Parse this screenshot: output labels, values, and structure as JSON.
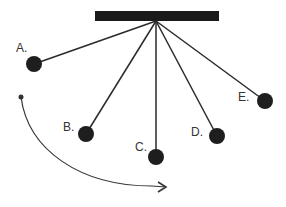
{
  "diagram": {
    "colors": {
      "bar": "#1a1a1a",
      "string": "#2a2a2a",
      "bob": "#1e1e1e",
      "arc": "#333333",
      "label": "#333333",
      "background": "#ffffff"
    },
    "support_bar": {
      "x": 95,
      "y": 11,
      "width": 124,
      "height": 10
    },
    "pivot": {
      "x": 156,
      "y": 21
    },
    "bob_radius": 8,
    "pendulums": [
      {
        "label": "A.",
        "bob": {
          "x": 34,
          "y": 64
        },
        "label_pos": {
          "x": 16,
          "y": 42
        }
      },
      {
        "label": "B.",
        "bob": {
          "x": 86,
          "y": 134
        },
        "label_pos": {
          "x": 63,
          "y": 121
        }
      },
      {
        "label": "C.",
        "bob": {
          "x": 156,
          "y": 157
        },
        "label_pos": {
          "x": 135,
          "y": 141
        }
      },
      {
        "label": "D.",
        "bob": {
          "x": 217,
          "y": 136
        },
        "label_pos": {
          "x": 191,
          "y": 126
        }
      },
      {
        "label": "E.",
        "bob": {
          "x": 265,
          "y": 101
        },
        "label_pos": {
          "x": 238,
          "y": 91
        }
      }
    ],
    "motion_arc": {
      "start_dot": {
        "x": 21,
        "y": 97,
        "r": 2.5
      },
      "path": "M21,97 C28,150 80,186 152,186",
      "arrow_tip": {
        "x": 166,
        "y": 187
      }
    }
  }
}
